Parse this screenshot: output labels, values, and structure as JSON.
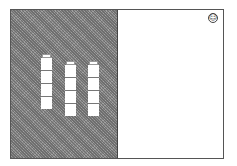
{
  "scene": {
    "columns": [
      {
        "blocks": 4,
        "has_cap": true,
        "left": 30,
        "top": 44
      },
      {
        "blocks": 4,
        "has_cap": true,
        "left": 54,
        "top": 51
      },
      {
        "blocks": 4,
        "has_cap": true,
        "left": 77,
        "top": 51
      }
    ],
    "smiley_icon": "☺",
    "colors": {
      "left_panel": "#8a8a8a",
      "right_panel": "#ffffff",
      "block": "#ffffff"
    }
  }
}
